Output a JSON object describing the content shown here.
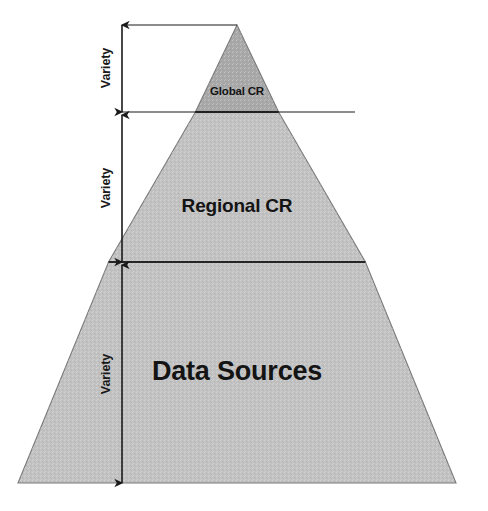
{
  "diagram": {
    "type": "pyramid",
    "title": "",
    "background_color": "#ffffff",
    "canvas": {
      "width": 488,
      "height": 511
    },
    "layers": [
      {
        "id": "global-cr",
        "label": "Global CR",
        "fill_color": "#a8a8a8",
        "stroke_color": "#3d3d3d",
        "level": 1,
        "label_x": 237,
        "label_y": 91,
        "font_size": 11.5
      },
      {
        "id": "regional-cr",
        "label": "Regional CR",
        "fill_color": "#c2c2c2",
        "stroke_color": "#7a7a7a",
        "level": 2,
        "label_x": 237,
        "label_y": 206,
        "font_size": 19
      },
      {
        "id": "data-sources",
        "label": "Data Sources",
        "fill_color": "#c2c2c2",
        "stroke_color": "#7a7a7a",
        "level": 3,
        "label_x": 237,
        "label_y": 371,
        "font_size": 27
      }
    ],
    "geometry": {
      "apex_x": 237,
      "apex_y": 25,
      "base_y": 483,
      "base_left_x": 18,
      "base_right_x": 456,
      "divider_1_y": 112,
      "divider_2_y": 262,
      "dimension_line_x": 122
    },
    "dimension_arrows": [
      {
        "id": "variety-1",
        "label": "Variety",
        "top_y": 25,
        "bottom_y": 112,
        "label_x": 106,
        "label_y": 68
      },
      {
        "id": "variety-2",
        "label": "Variety",
        "top_y": 115,
        "bottom_y": 262,
        "label_x": 106,
        "label_y": 188
      },
      {
        "id": "variety-3",
        "label": "Variety",
        "top_y": 265,
        "bottom_y": 483,
        "label_x": 106,
        "label_y": 374
      }
    ],
    "leader_lines": [
      {
        "id": "leader-apex",
        "y": 25,
        "x_start": 122,
        "x_end": 237
      },
      {
        "id": "leader-divider-1",
        "y": 112,
        "x_start": 122,
        "x_end": 355
      }
    ],
    "colors": {
      "line": "#1a1a1a",
      "text": "#141414",
      "cap_fill": "#a8a8a8",
      "body_fill": "#c2c2c2"
    }
  }
}
